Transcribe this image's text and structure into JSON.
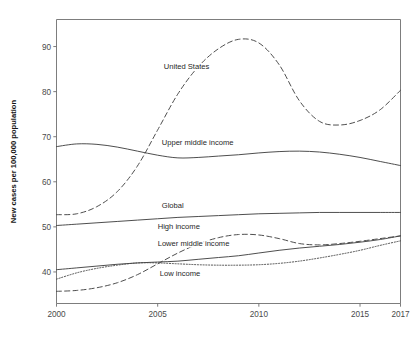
{
  "chart_data": {
    "type": "line",
    "title": "",
    "xlabel": "",
    "ylabel": "New cases per 100,000 population",
    "xlim": [
      2000,
      2017
    ],
    "ylim": [
      33,
      96
    ],
    "grid": false,
    "legend": "inline-labels",
    "x_ticks": [
      "2000",
      "2005",
      "2010",
      "2015",
      "2017"
    ],
    "x_tick_values": [
      2000,
      2005,
      2010,
      2015,
      2017
    ],
    "y_ticks": [
      "40",
      "50",
      "60",
      "70",
      "80",
      "90"
    ],
    "y_tick_values": [
      40,
      50,
      60,
      70,
      80,
      90
    ],
    "x": [
      2000,
      2001,
      2002,
      2003,
      2004,
      2005,
      2006,
      2007,
      2008,
      2009,
      2010,
      2011,
      2012,
      2013,
      2014,
      2015,
      2016,
      2017
    ],
    "series": [
      {
        "name": "United States",
        "style": "dashed",
        "label_x": 2005.3,
        "label_y": 85.0,
        "values": [
          52.7,
          52.9,
          54.5,
          57.8,
          63.5,
          71.5,
          79.5,
          85.5,
          89.5,
          91.6,
          90.8,
          86.0,
          78.0,
          73.4,
          72.6,
          73.6,
          76.0,
          80.3
        ]
      },
      {
        "name": "Upper middle income",
        "style": "solid",
        "label_x": 2005.2,
        "label_y": 68.2,
        "values": [
          67.8,
          68.4,
          68.3,
          67.7,
          66.8,
          65.9,
          65.3,
          65.4,
          65.7,
          66.0,
          66.4,
          66.7,
          66.8,
          66.6,
          66.1,
          65.4,
          64.5,
          63.6
        ]
      },
      {
        "name": "Global",
        "style": "solid",
        "label_x": 2005.2,
        "label_y": 54.1,
        "values": [
          50.3,
          50.6,
          50.9,
          51.2,
          51.5,
          51.8,
          52.1,
          52.3,
          52.5,
          52.7,
          52.9,
          53.0,
          53.1,
          53.2,
          53.2,
          53.2,
          53.2,
          53.2
        ]
      },
      {
        "name": "High income",
        "style": "dashed",
        "label_x": 2005.0,
        "label_y": 49.6,
        "values": [
          35.7,
          35.9,
          36.5,
          37.6,
          39.4,
          41.8,
          44.2,
          46.2,
          47.6,
          48.3,
          48.2,
          47.4,
          46.3,
          46.0,
          46.3,
          46.8,
          47.4,
          48.0
        ]
      },
      {
        "name": "Lower middle income",
        "style": "solid",
        "label_x": 2005.0,
        "label_y": 45.8,
        "values": [
          40.5,
          40.9,
          41.3,
          41.7,
          42.0,
          42.2,
          42.4,
          42.8,
          43.2,
          43.6,
          44.2,
          44.8,
          45.3,
          45.7,
          46.1,
          46.6,
          47.2,
          48.0
        ]
      },
      {
        "name": "Low income",
        "style": "dotted",
        "label_x": 2005.1,
        "label_y": 39.2,
        "values": [
          38.4,
          39.8,
          40.8,
          41.5,
          42.0,
          42.0,
          41.8,
          41.6,
          41.5,
          41.5,
          41.6,
          41.9,
          42.4,
          43.1,
          43.9,
          44.8,
          45.9,
          46.9
        ]
      }
    ]
  },
  "figure": {
    "background_color": "#ffffff",
    "line_color": "#444444",
    "axis_color": "#6e6e6e"
  }
}
